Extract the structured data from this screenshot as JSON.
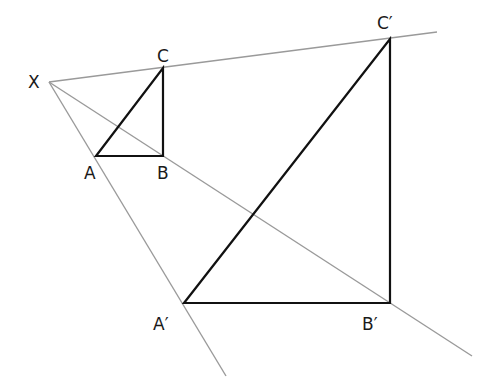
{
  "diagram": {
    "type": "enlargement-construction",
    "center_of_enlargement": {
      "label": "X",
      "x": 49,
      "y": 82
    },
    "original_triangle": {
      "vertices": [
        {
          "label": "A",
          "x": 96,
          "y": 156
        },
        {
          "label": "B",
          "x": 163,
          "y": 156
        },
        {
          "label": "C",
          "x": 163,
          "y": 68
        }
      ]
    },
    "image_triangle": {
      "vertices": [
        {
          "label": "A′",
          "x": 184,
          "y": 303
        },
        {
          "label": "B′",
          "x": 390,
          "y": 303
        },
        {
          "label": "C′",
          "x": 390,
          "y": 39
        }
      ]
    },
    "rays": [
      {
        "name": "ray-through-A",
        "from": [
          49,
          82
        ],
        "to": [
          226,
          376
        ]
      },
      {
        "name": "ray-through-B",
        "from": [
          49,
          82
        ],
        "to": [
          472,
          356
        ]
      },
      {
        "name": "ray-through-C",
        "from": [
          49,
          82
        ],
        "to": [
          437,
          32
        ]
      }
    ],
    "labels": {
      "X": "X",
      "A": "A",
      "B": "B",
      "C": "C",
      "A_prime": "A′",
      "B_prime": "B′",
      "C_prime": "C′"
    },
    "colors": {
      "ray": "#9a9a9a",
      "edge": "#111111",
      "label": "#1a1a1a",
      "background": "#ffffff"
    }
  }
}
